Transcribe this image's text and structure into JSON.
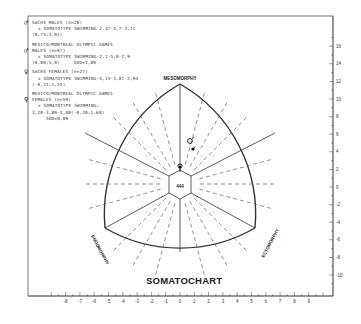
{
  "chart_data": {
    "type": "scatter",
    "title": "SOMATOCHART",
    "vertices": {
      "top": "MESOMORPHY",
      "left": "ENDOMORPHY",
      "right": "ECTOMORPHY"
    },
    "x_axis": {
      "ticks": [
        -8,
        -7,
        -6,
        -5,
        -4,
        -3,
        -2,
        -1,
        0,
        1,
        2,
        3,
        4,
        5,
        6,
        7,
        8,
        9
      ],
      "range": [
        -9,
        10
      ]
    },
    "y_axis": {
      "ticks": [
        16,
        14,
        12,
        10,
        8,
        6,
        4,
        2,
        0,
        -2,
        -4,
        -6,
        -8,
        -10
      ],
      "range": [
        -11,
        17
      ]
    },
    "grid": true,
    "legend_position": "upper-left",
    "legend": [
      {
        "symbol": "male-filled",
        "lines": [
          "SACHS MALES (n=28)",
          "x SOMATOTYPE SWIMMING-2,37-4,7-3,12",
          "(0,75;3,91)"
        ]
      },
      {
        "symbol": "male-open",
        "lines": [
          "MEXICO/MONTREAL OLYMPIC GAMES",
          "MALES (n=97)",
          "x SOMATOTYPE SWIMMING-2,1-5,0-2,9",
          "(0,80;5,0)     SOD=1,89"
        ]
      },
      {
        "symbol": "female-filled",
        "lines": [
          "SACHS FEMALES (n=27)",
          "x SOMATOTYPE SWIMMING-3,15-3,87-2,94",
          "(-0,21;1,55)"
        ]
      },
      {
        "symbol": "female-open",
        "lines": [
          "MEXICO/MONTREAL OLYMPIC GAMES",
          "FEMALES (n=59)",
          "x SOMATOTYPE SWIMMING:",
          "3,20-3,89-3,00(-0,20;1,60)",
          "SOD=0,09"
        ]
      }
    ],
    "series": [
      {
        "name": "Sachs males",
        "x": 0.75,
        "y": 3.91,
        "somatotype": [
          2.37,
          4.7,
          3.12
        ]
      },
      {
        "name": "Mexico/Montreal Olympic males",
        "x": 0.8,
        "y": 5.0,
        "somatotype": [
          2.1,
          5.0,
          2.9
        ]
      },
      {
        "name": "Sachs females",
        "x": -0.21,
        "y": 1.55,
        "somatotype": [
          3.15,
          3.87,
          2.94
        ]
      },
      {
        "name": "Mexico/Montreal Olympic females",
        "x": -0.2,
        "y": 1.6,
        "somatotype": [
          3.2,
          3.89,
          3.0
        ]
      }
    ],
    "center_label": "444"
  }
}
